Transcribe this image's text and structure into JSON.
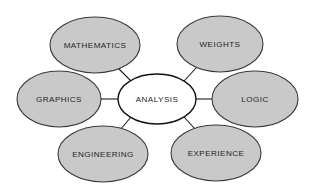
{
  "diagram": {
    "type": "radial-concept-map",
    "title": "ANALYSIS",
    "background_color": "#ffffff",
    "center": {
      "id": "analysis",
      "label": "ANALYSIS",
      "fill_color": "#ffffff",
      "stroke_color": "#101010",
      "cx": 157,
      "cy": 99,
      "rx": 39,
      "ry": 25
    },
    "satellites": [
      {
        "id": "mathematics",
        "label": "MATHEMATICS",
        "fill_color": "#c9c9c9",
        "stroke_color": "#3a3a3a",
        "cx": 95,
        "cy": 45,
        "rx": 45,
        "ry": 28,
        "position": "top-left"
      },
      {
        "id": "weights",
        "label": "WEIGHTS",
        "fill_color": "#c9c9c9",
        "stroke_color": "#3a3a3a",
        "cx": 220,
        "cy": 44,
        "rx": 43,
        "ry": 28,
        "position": "top-right"
      },
      {
        "id": "graphics",
        "label": "GRAPHICS",
        "fill_color": "#c9c9c9",
        "stroke_color": "#3a3a3a",
        "cx": 59,
        "cy": 99,
        "rx": 42,
        "ry": 28,
        "position": "left"
      },
      {
        "id": "logic",
        "label": "LOGIC",
        "fill_color": "#c9c9c9",
        "stroke_color": "#3a3a3a",
        "cx": 255,
        "cy": 99,
        "rx": 43,
        "ry": 28,
        "position": "right"
      },
      {
        "id": "engineering",
        "label": "ENGINEERING",
        "fill_color": "#c9c9c9",
        "stroke_color": "#3a3a3a",
        "cx": 103,
        "cy": 154,
        "rx": 45,
        "ry": 28,
        "position": "bottom-left"
      },
      {
        "id": "experience",
        "label": "EXPERIENCE",
        "fill_color": "#c9c9c9",
        "stroke_color": "#3a3a3a",
        "cx": 216,
        "cy": 153,
        "rx": 45,
        "ry": 28,
        "position": "bottom-right"
      }
    ],
    "connectors": [
      {
        "id": "analysis-mathematics",
        "from": "analysis",
        "to": "mathematics",
        "x1": 131,
        "y1": 81,
        "x2": 118,
        "y2": 68
      },
      {
        "id": "analysis-weights",
        "from": "analysis",
        "to": "weights",
        "x1": 184,
        "y1": 81,
        "x2": 197,
        "y2": 67
      },
      {
        "id": "analysis-graphics",
        "from": "analysis",
        "to": "graphics",
        "x1": 118,
        "y1": 99,
        "x2": 101,
        "y2": 99
      },
      {
        "id": "analysis-logic",
        "from": "analysis",
        "to": "logic",
        "x1": 196,
        "y1": 99,
        "x2": 212,
        "y2": 99
      },
      {
        "id": "analysis-engineering",
        "from": "analysis",
        "to": "engineering",
        "x1": 131,
        "y1": 117,
        "x2": 120,
        "y2": 130
      },
      {
        "id": "analysis-experience",
        "from": "analysis",
        "to": "experience",
        "x1": 184,
        "y1": 117,
        "x2": 196,
        "y2": 130
      }
    ]
  }
}
